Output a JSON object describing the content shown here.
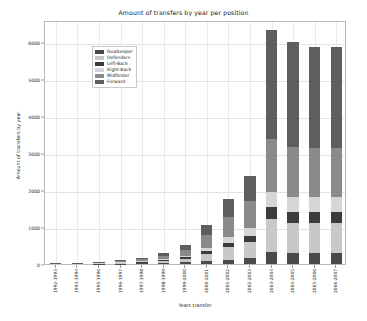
{
  "chart_data": {
    "type": "bar",
    "subtype": "stacked-bar",
    "title": "Amount of transfers by year per position",
    "xlabel": "Years transfer",
    "ylabel": "Amount of transfers by year",
    "grid": true,
    "legend_position": "upper left",
    "ylim": [
      0,
      6600
    ],
    "yticks": [
      0,
      1000,
      2000,
      3000,
      4000,
      5000,
      6000
    ],
    "ytick_labels": [
      "0",
      "1000",
      "2000",
      "3000",
      "4000",
      "5000",
      "6000"
    ],
    "categories": [
      "1992-1993",
      "1993-1994",
      "1995-1996",
      "1996-1997",
      "1997-1998",
      "1998-1999",
      "1999-2000",
      "2000-2001",
      "2001-2002",
      "2002-2003",
      "2003-2004",
      "2004-2005",
      "2005-2006",
      "2006-2007"
    ],
    "series": [
      {
        "name": "Goalkeeper",
        "color": "#4a4a4a",
        "values": [
          2,
          3,
          9,
          12,
          20,
          34,
          45,
          78,
          120,
          160,
          330,
          300,
          300,
          300
        ]
      },
      {
        "name": "Defenders",
        "color": "#c8c8c8",
        "values": [
          3,
          5,
          14,
          20,
          34,
          60,
          95,
          190,
          330,
          430,
          880,
          820,
          820,
          820
        ]
      },
      {
        "name": "Left-Back",
        "color": "#3c3c3c",
        "values": [
          1,
          2,
          5,
          7,
          11,
          22,
          38,
          80,
          120,
          170,
          330,
          300,
          300,
          300
        ]
      },
      {
        "name": "Right-Back",
        "color": "#d6d6d6",
        "values": [
          1,
          2,
          6,
          9,
          14,
          26,
          46,
          95,
          155,
          210,
          420,
          390,
          390,
          390
        ]
      },
      {
        "name": "Midfielder",
        "color": "#8a8a8a",
        "values": [
          4,
          7,
          18,
          26,
          44,
          78,
          150,
          330,
          540,
          730,
          1430,
          1350,
          1330,
          1330
        ]
      },
      {
        "name": "Forward",
        "color": "#5e5e5e",
        "values": [
          4,
          6,
          16,
          23,
          40,
          70,
          135,
          290,
          490,
          680,
          2950,
          2840,
          2730,
          2730
        ]
      }
    ],
    "totals": [
      15,
      25,
      68,
      97,
      163,
      290,
      509,
      1063,
      1755,
      2380,
      6340,
      6000,
      5870,
      5870
    ]
  },
  "legend": {
    "entries": [
      {
        "label": "Goalkeeper"
      },
      {
        "label": "Defenders"
      },
      {
        "label": "Left-Back"
      },
      {
        "label": "Right-Back"
      },
      {
        "label": "Midfielder"
      },
      {
        "label": "Forward"
      }
    ]
  }
}
